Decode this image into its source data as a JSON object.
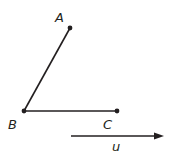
{
  "diagram": {
    "type": "geometry",
    "points": [
      {
        "id": "A",
        "label": "A",
        "x": 70,
        "y": 28,
        "lx": 55,
        "ly": 22
      },
      {
        "id": "B",
        "label": "B",
        "x": 24,
        "y": 111,
        "lx": 8,
        "ly": 129
      },
      {
        "id": "C",
        "label": "C",
        "x": 117,
        "y": 111,
        "lx": 103,
        "ly": 129
      }
    ],
    "segments": [
      {
        "from": "B",
        "to": "A"
      },
      {
        "from": "B",
        "to": "C"
      }
    ],
    "vector": {
      "label": "u",
      "x1": 71,
      "y1": 136,
      "x2": 163,
      "y2": 136,
      "lx": 112,
      "ly": 151
    },
    "color": "#231f20"
  }
}
